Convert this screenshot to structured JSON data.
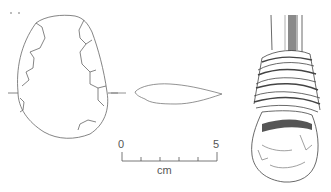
{
  "figure": {
    "views": [
      "face view",
      "cross-section",
      "hafted reconstruction"
    ],
    "scale_bar": {
      "start_label": "0",
      "end_label": "5",
      "unit_label": "cm",
      "ticks": 5
    },
    "colors": {
      "line": "#555555",
      "background": "#ffffff",
      "shading": "#7a7a7a"
    }
  }
}
